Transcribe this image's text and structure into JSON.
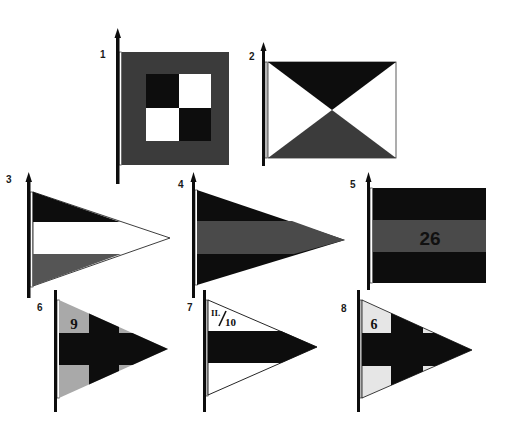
{
  "colors": {
    "black": "#0d0d0d",
    "dark_gray": "#3b3b3b",
    "mid_gray": "#555555",
    "light_gray": "#a9a9a9",
    "pale_gray": "#e6e6e6",
    "white": "#ffffff"
  },
  "flags": [
    {
      "number": "1",
      "shape": "square",
      "description": "dark border with 2x2 black/white checker center"
    },
    {
      "number": "2",
      "shape": "rectangle",
      "description": "white field with black top triangle and gray bottom triangle meeting at center"
    },
    {
      "number": "3",
      "shape": "pennant",
      "description": "horizontal stripes black / white / gray"
    },
    {
      "number": "4",
      "shape": "pennant",
      "description": "horizontal stripes black / gray / black"
    },
    {
      "number": "5",
      "shape": "rectangle",
      "description": "horizontal stripes black / gray / black with number",
      "label": "26"
    },
    {
      "number": "6",
      "shape": "pennant",
      "description": "black cross on gray field with number in canton",
      "label": "9"
    },
    {
      "number": "7",
      "shape": "pennant",
      "description": "white field with black center band and fraction in canton",
      "label_numerator": "II.",
      "label_denominator": "10"
    },
    {
      "number": "8",
      "shape": "pennant",
      "description": "black cross on pale field with number in canton",
      "label": "6"
    }
  ]
}
